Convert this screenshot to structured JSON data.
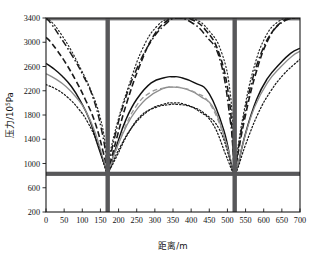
{
  "chart_data": {
    "type": "line",
    "title": "",
    "xlabel": "距离/m",
    "ylabel": "压力/10⁵Pa",
    "ylabel_base": "压力/10",
    "ylabel_exp": "5",
    "ylabel_unit": "Pa",
    "xlim": [
      0,
      700
    ],
    "ylim": [
      200,
      3400
    ],
    "xticks": [
      0,
      50,
      100,
      150,
      200,
      250,
      300,
      350,
      400,
      450,
      500,
      550,
      600,
      650,
      700
    ],
    "yticks": [
      200,
      600,
      1000,
      1400,
      1800,
      2200,
      2600,
      3000,
      3400
    ],
    "xtick_labels": [
      "0",
      "50",
      "100",
      "150",
      "200",
      "250",
      "300",
      "350",
      "400",
      "450",
      "500",
      "550",
      "600",
      "650",
      "700"
    ],
    "ytick_labels": [
      "200",
      "600",
      "1000",
      "1400",
      "1800",
      "2200",
      "2600",
      "3000",
      "3400"
    ],
    "grid": false,
    "legend": "none",
    "annotations": [
      {
        "name": "shaft-left",
        "type": "vertical-bar",
        "x": 170,
        "color": "#58585a"
      },
      {
        "name": "shaft-right",
        "type": "vertical-bar",
        "x": 520,
        "color": "#58585a"
      },
      {
        "name": "roadway-line",
        "type": "horizontal-bar",
        "y": 830,
        "color": "#58585a"
      }
    ],
    "series": [
      {
        "name": "curve-1-solid",
        "style": "solid",
        "color": "#111111",
        "x": [
          0,
          20,
          45,
          70,
          95,
          120,
          145,
          163,
          170,
          177,
          195,
          220,
          250,
          290,
          330,
          350,
          370,
          410,
          450,
          490,
          512,
          520,
          528,
          550,
          580,
          610,
          645,
          675,
          700
        ],
        "y": [
          2650,
          2570,
          2440,
          2270,
          2030,
          1720,
          1260,
          950,
          830,
          950,
          1300,
          1720,
          2060,
          2330,
          2420,
          2430,
          2420,
          2330,
          2150,
          1550,
          950,
          830,
          950,
          1500,
          2050,
          2400,
          2650,
          2820,
          2900
        ]
      },
      {
        "name": "curve-2-gray",
        "style": "solid",
        "color": "#8c8c8c",
        "x": [
          0,
          25,
          55,
          85,
          110,
          135,
          158,
          170,
          182,
          205,
          235,
          275,
          320,
          350,
          385,
          425,
          465,
          500,
          515,
          520,
          527,
          545,
          575,
          610,
          648,
          678,
          700
        ],
        "y": [
          2480,
          2400,
          2270,
          2080,
          1860,
          1520,
          1060,
          830,
          1060,
          1400,
          1760,
          2060,
          2230,
          2260,
          2230,
          2110,
          1880,
          1260,
          900,
          830,
          930,
          1380,
          1930,
          2330,
          2600,
          2770,
          2850
        ]
      },
      {
        "name": "curve-3-dotted",
        "style": "dotted",
        "color": "#1a1a1a",
        "x": [
          0,
          30,
          60,
          90,
          115,
          140,
          160,
          170,
          181,
          205,
          240,
          285,
          325,
          350,
          380,
          420,
          460,
          495,
          513,
          520,
          529,
          550,
          585,
          620,
          655,
          685,
          700
        ],
        "y": [
          2300,
          2220,
          2090,
          1900,
          1680,
          1360,
          980,
          830,
          980,
          1280,
          1620,
          1880,
          1980,
          2000,
          1980,
          1870,
          1650,
          1150,
          880,
          830,
          930,
          1310,
          1830,
          2200,
          2470,
          2640,
          2720
        ]
      },
      {
        "name": "curve-4-dashdot",
        "style": "dashdot",
        "color": "#1a1a1a",
        "x": [
          0,
          15,
          40,
          70,
          100,
          130,
          155,
          168,
          170,
          174,
          190,
          215,
          250,
          290,
          330,
          360,
          400,
          440,
          480,
          508,
          518,
          520,
          524,
          540,
          565,
          595,
          625,
          660,
          690,
          700
        ],
        "y": [
          3400,
          3300,
          3080,
          2800,
          2480,
          2080,
          1500,
          1000,
          830,
          1000,
          1450,
          2000,
          2560,
          3020,
          3300,
          3400,
          3330,
          3110,
          2700,
          1700,
          1000,
          830,
          1000,
          1600,
          2300,
          2850,
          3180,
          3360,
          3400,
          3400
        ]
      },
      {
        "name": "curve-5-dash",
        "style": "dash",
        "color": "#1a1a1a",
        "x": [
          0,
          12,
          30,
          55,
          82,
          108,
          135,
          158,
          168,
          170,
          175,
          195,
          222,
          258,
          298,
          340,
          370,
          400,
          440,
          478,
          505,
          516,
          520,
          526,
          548,
          578,
          612,
          648,
          682,
          700
        ],
        "y": [
          3080,
          3010,
          2870,
          2650,
          2370,
          2060,
          1680,
          1180,
          900,
          830,
          950,
          1420,
          1990,
          2610,
          3120,
          3380,
          3400,
          3380,
          3200,
          2800,
          2050,
          1150,
          830,
          1050,
          1750,
          2480,
          3040,
          3330,
          3400,
          3400
        ]
      },
      {
        "name": "curve-6-dotfine",
        "style": "dotted-fine",
        "color": "#2a2a2a",
        "x": [
          0,
          18,
          42,
          68,
          95,
          122,
          148,
          165,
          170,
          176,
          198,
          228,
          265,
          305,
          345,
          375,
          410,
          448,
          484,
          508,
          517,
          520,
          525,
          545,
          572,
          604,
          640,
          674,
          700
        ],
        "y": [
          3400,
          3320,
          3130,
          2880,
          2570,
          2230,
          1790,
          1250,
          830,
          1150,
          1700,
          2280,
          2880,
          3260,
          3400,
          3400,
          3380,
          3200,
          2830,
          2150,
          1200,
          830,
          1100,
          1840,
          2560,
          3080,
          3340,
          3400,
          3400
        ]
      },
      {
        "name": "curve-7-graydash",
        "style": "dashed-gray",
        "color": "#9a9a9a",
        "x": [
          170,
          190,
          215,
          250,
          290,
          330,
          350,
          372,
          412,
          452,
          492,
          515,
          520
        ],
        "y": [
          830,
          1160,
          1560,
          1960,
          2180,
          2250,
          2260,
          2250,
          2170,
          1980,
          1420,
          900,
          830
        ]
      },
      {
        "name": "curve-8-dotted-inner",
        "style": "dotted",
        "color": "#1a1a1a",
        "x": [
          170,
          195,
          225,
          262,
          305,
          340,
          360,
          398,
          438,
          478,
          506,
          516,
          520
        ],
        "y": [
          830,
          1120,
          1480,
          1790,
          1930,
          1970,
          1975,
          1940,
          1820,
          1560,
          1080,
          870,
          830
        ]
      }
    ]
  }
}
